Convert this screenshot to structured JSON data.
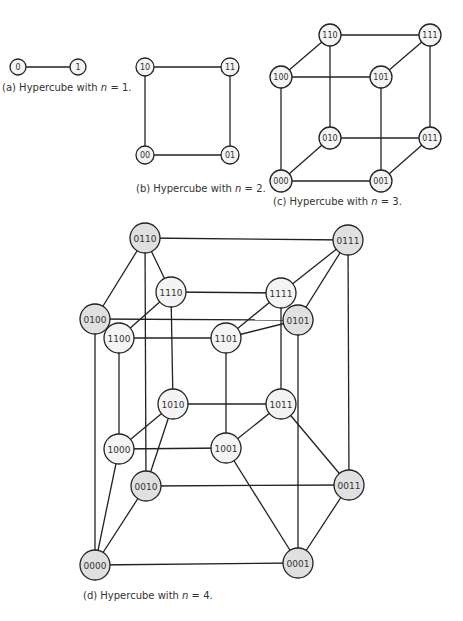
{
  "colors": {
    "stroke": "#222222",
    "node_light": "#f4f4f4",
    "node_gray": "#e0e0e0",
    "text": "#333333"
  },
  "diagrams": [
    {
      "id": "a",
      "caption_prefix": "(a) Hypercube with ",
      "caption_var": "n",
      "caption_suffix": " = 1.",
      "caption_pos": [
        2,
        82
      ],
      "node_radius": 8,
      "font_size": 8,
      "nodes": [
        {
          "label": "0",
          "x": 18,
          "y": 67,
          "fill": "light"
        },
        {
          "label": "1",
          "x": 78,
          "y": 67,
          "fill": "light"
        }
      ],
      "edges": [
        [
          "0",
          "1"
        ]
      ]
    },
    {
      "id": "b",
      "caption_prefix": "(b) Hypercube with ",
      "caption_var": "n",
      "caption_suffix": " = 2.",
      "caption_pos": [
        136,
        183
      ],
      "node_radius": 9,
      "font_size": 8,
      "nodes": [
        {
          "label": "10",
          "x": 145,
          "y": 67,
          "fill": "light"
        },
        {
          "label": "11",
          "x": 230,
          "y": 67,
          "fill": "light"
        },
        {
          "label": "00",
          "x": 145,
          "y": 155,
          "fill": "light"
        },
        {
          "label": "01",
          "x": 230,
          "y": 155,
          "fill": "light"
        }
      ],
      "edges": [
        [
          "10",
          "11"
        ],
        [
          "10",
          "00"
        ],
        [
          "11",
          "01"
        ],
        [
          "00",
          "01"
        ]
      ]
    },
    {
      "id": "c",
      "caption_prefix": "(c) Hypercube with ",
      "caption_var": "n",
      "caption_suffix": " = 3.",
      "caption_pos": [
        273,
        196
      ],
      "node_radius": 11,
      "font_size": 8,
      "nodes": [
        {
          "label": "110",
          "x": 330,
          "y": 35,
          "fill": "light"
        },
        {
          "label": "111",
          "x": 430,
          "y": 35,
          "fill": "light"
        },
        {
          "label": "100",
          "x": 281,
          "y": 77,
          "fill": "light"
        },
        {
          "label": "101",
          "x": 381,
          "y": 77,
          "fill": "light"
        },
        {
          "label": "010",
          "x": 330,
          "y": 138,
          "fill": "light"
        },
        {
          "label": "011",
          "x": 430,
          "y": 138,
          "fill": "light"
        },
        {
          "label": "000",
          "x": 281,
          "y": 181,
          "fill": "light"
        },
        {
          "label": "001",
          "x": 381,
          "y": 181,
          "fill": "light"
        }
      ],
      "edges": [
        [
          "110",
          "111"
        ],
        [
          "110",
          "100"
        ],
        [
          "111",
          "101"
        ],
        [
          "100",
          "101"
        ],
        [
          "110",
          "010"
        ],
        [
          "111",
          "011"
        ],
        [
          "100",
          "000"
        ],
        [
          "101",
          "001"
        ],
        [
          "010",
          "011"
        ],
        [
          "010",
          "000"
        ],
        [
          "011",
          "001"
        ],
        [
          "000",
          "001"
        ]
      ]
    },
    {
      "id": "d",
      "caption_prefix": "(d) Hypercube with ",
      "caption_var": "n",
      "caption_suffix": " = 4.",
      "caption_pos": [
        83,
        590
      ],
      "node_radius": 15,
      "font_size": 9,
      "nodes": [
        {
          "label": "0110",
          "x": 145,
          "y": 238,
          "fill": "gray"
        },
        {
          "label": "0111",
          "x": 348,
          "y": 240,
          "fill": "gray"
        },
        {
          "label": "1110",
          "x": 171,
          "y": 292,
          "fill": "light"
        },
        {
          "label": "1111",
          "x": 281,
          "y": 293,
          "fill": "light"
        },
        {
          "label": "0100",
          "x": 95,
          "y": 319,
          "fill": "gray"
        },
        {
          "label": "0101",
          "x": 298,
          "y": 320,
          "fill": "gray"
        },
        {
          "label": "1100",
          "x": 119,
          "y": 338,
          "fill": "light"
        },
        {
          "label": "1101",
          "x": 226,
          "y": 338,
          "fill": "light"
        },
        {
          "label": "1010",
          "x": 173,
          "y": 404,
          "fill": "light"
        },
        {
          "label": "1011",
          "x": 281,
          "y": 404,
          "fill": "light"
        },
        {
          "label": "1000",
          "x": 119,
          "y": 449,
          "fill": "light"
        },
        {
          "label": "1001",
          "x": 226,
          "y": 448,
          "fill": "light"
        },
        {
          "label": "0010",
          "x": 146,
          "y": 486,
          "fill": "gray"
        },
        {
          "label": "0011",
          "x": 349,
          "y": 485,
          "fill": "gray"
        },
        {
          "label": "0000",
          "x": 95,
          "y": 565,
          "fill": "gray"
        },
        {
          "label": "0001",
          "x": 298,
          "y": 563,
          "fill": "gray"
        }
      ],
      "edges": [
        [
          "0110",
          "0111"
        ],
        [
          "0110",
          "0100"
        ],
        [
          "0110",
          "1110"
        ],
        [
          "0110",
          "0010"
        ],
        [
          "0111",
          "1111"
        ],
        [
          "0111",
          "0101"
        ],
        [
          "0111",
          "0011"
        ],
        [
          "1110",
          "1111"
        ],
        [
          "1110",
          "1100"
        ],
        [
          "1110",
          "1010"
        ],
        [
          "1111",
          "1101"
        ],
        [
          "1111",
          "1011"
        ],
        [
          "0100",
          "0101"
        ],
        [
          "0100",
          "1100"
        ],
        [
          "0100",
          "0000"
        ],
        [
          "0101",
          "1101"
        ],
        [
          "0101",
          "0001"
        ],
        [
          "1100",
          "1101"
        ],
        [
          "1100",
          "1000"
        ],
        [
          "1101",
          "1001"
        ],
        [
          "1010",
          "1011"
        ],
        [
          "1010",
          "1000"
        ],
        [
          "1010",
          "0010"
        ],
        [
          "1011",
          "1001"
        ],
        [
          "1011",
          "0011"
        ],
        [
          "1000",
          "1001"
        ],
        [
          "1000",
          "0000"
        ],
        [
          "1001",
          "0001"
        ],
        [
          "0010",
          "0011"
        ],
        [
          "0010",
          "0000"
        ],
        [
          "0011",
          "0001"
        ],
        [
          "0000",
          "0001"
        ]
      ]
    }
  ]
}
